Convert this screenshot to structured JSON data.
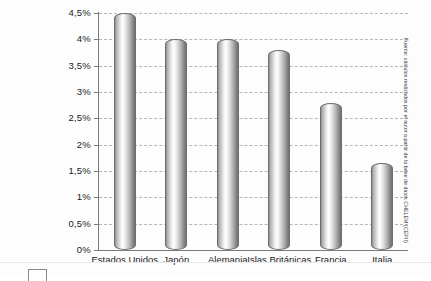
{
  "chart_data": {
    "type": "bar",
    "title": "",
    "xlabel": "",
    "ylabel": "",
    "categories": [
      "Estados Unidos",
      "Japón",
      "Alemania",
      "Islas Británicas",
      "Francia",
      "Italia"
    ],
    "values": [
      4.5,
      4.0,
      4.0,
      3.8,
      2.8,
      1.65
    ],
    "ylim": [
      0,
      4.5
    ],
    "ytick_values": [
      0,
      0.5,
      1,
      1.5,
      2,
      2.5,
      3,
      3.5,
      4,
      4.5
    ],
    "ytick_labels": [
      "0%",
      "0,5%",
      "1%",
      "1,5%",
      "2%",
      "2,5%",
      "3%",
      "3,5%",
      "4%",
      "4,5%"
    ],
    "grid": true,
    "gridline_style": "dashed",
    "legend": [],
    "legend_position": "none",
    "bar_style": "cylinder-gradient-gray",
    "annotations": [
      "Fuente: cálculos realizados por el autor a partir de la base de datos CHELEM (CEPII)"
    ]
  },
  "source_note": {
    "text": "Fuente: cálculos realizados por el autor a partir de la base de datos CHELEM (CEPII)",
    "orientation": "vertical"
  },
  "colors": {
    "axis": "#7a7a7a",
    "gridline": "#a9a9b8",
    "text": "#1a1a1a",
    "background": "#fdfdfd",
    "bar_light": "#ffffff",
    "bar_dark": "#6f6f6f"
  }
}
